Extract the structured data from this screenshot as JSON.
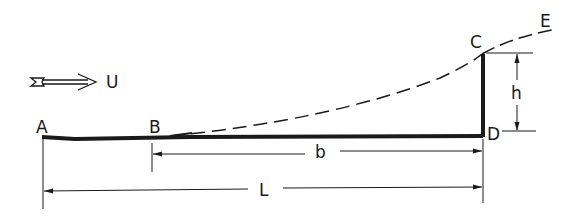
{
  "diagram": {
    "type": "flat plate with rear step / cavity, dashed separation streamline",
    "flow": {
      "label": "U",
      "direction": "left-to-right",
      "icon": "double-arrow-icon"
    },
    "points": {
      "A": "A",
      "B": "B",
      "C": "C",
      "D": "D",
      "E": "E"
    },
    "dimensions": {
      "b": "b",
      "L": "L",
      "h": "h"
    },
    "colors": {
      "ink": "#1a1a1a",
      "background": "#ffffff"
    }
  }
}
